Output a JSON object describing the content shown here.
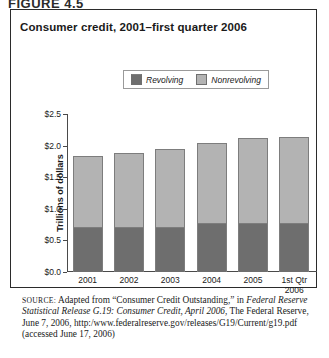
{
  "figure": {
    "label": "FIGURE 4.5",
    "title": "Consumer credit, 2001–first quarter 2006"
  },
  "legend": {
    "items": [
      {
        "label": "Revolving",
        "color": "#6e6e6e"
      },
      {
        "label": "Nonrevolving",
        "color": "#b3b3b3"
      }
    ]
  },
  "source": {
    "kicker": "SOURCE:",
    "part1": " Adapted from “Consumer Credit Outstanding,” in ",
    "italic1": "Federal Reserve Statistical Release G.19: Consumer Credit, April 2006",
    "part2": ", The Federal Reserve, June 7, 2006, http:/www.federalreserve.gov/releases/G19/Current/g19.pdf (accessed June 17, 2006)"
  },
  "chart_data": {
    "type": "bar",
    "subtype": "stacked-vertical",
    "title": "Consumer credit, 2001–first quarter 2006",
    "xlabel": "",
    "ylabel": "Trillions of dollars",
    "categories": [
      "2001",
      "2002",
      "2003",
      "2004",
      "2005",
      "1st Qtr 2006"
    ],
    "category_lines": [
      [
        "2001"
      ],
      [
        "2002"
      ],
      [
        "2003"
      ],
      [
        "2004"
      ],
      [
        "2005"
      ],
      [
        "1st Qtr",
        "2006"
      ]
    ],
    "series": [
      {
        "name": "Revolving",
        "color": "#6e6e6e",
        "values": [
          0.72,
          0.72,
          0.72,
          0.77,
          0.78,
          0.78
        ]
      },
      {
        "name": "Nonrevolving",
        "color": "#b3b3b3",
        "values": [
          1.12,
          1.16,
          1.23,
          1.27,
          1.34,
          1.36
        ]
      }
    ],
    "totals": [
      1.84,
      1.88,
      1.95,
      2.04,
      2.12,
      2.14
    ],
    "ylim": [
      0.0,
      2.5
    ],
    "yticks": [
      0.0,
      0.5,
      1.0,
      1.5,
      2.0,
      2.5
    ],
    "ytick_labels": [
      "$0.0",
      "$0.5",
      "$1.0",
      "$1.5",
      "$2.0",
      "$2.5"
    ],
    "grid": false,
    "legend_position": "top-center"
  }
}
